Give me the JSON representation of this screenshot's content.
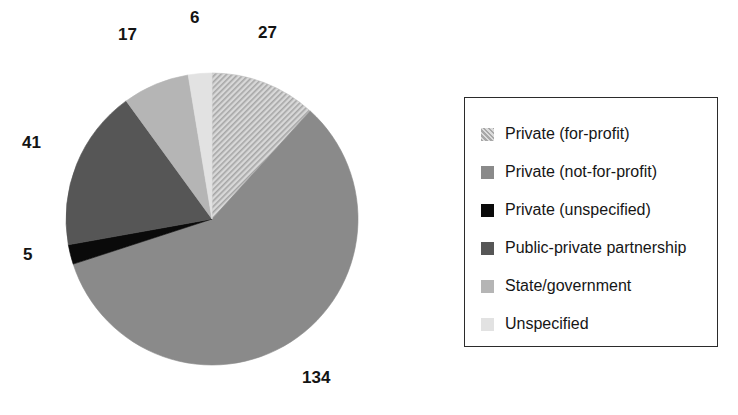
{
  "chart_data": {
    "type": "pie",
    "title": "",
    "subtitle": "",
    "xlabel": "",
    "ylabel": "",
    "total": 230,
    "legend_position": "right",
    "grid": false,
    "label_format": "count",
    "start_angle_deg": 0,
    "direction": "clockwise",
    "categories": [
      "Private (for-profit)",
      "Private (not-for-profit)",
      "Private (unspecified)",
      "Public-private partnership",
      "State/government",
      "Unspecified"
    ],
    "values": [
      27,
      134,
      5,
      41,
      17,
      6
    ],
    "labels": [
      "27",
      "134",
      "5",
      "41",
      "17",
      "6"
    ],
    "colors": [
      "#c9c9c9",
      "#8a8a8a",
      "#0a0a0a",
      "#565656",
      "#b5b5b5",
      "#e2e2e2"
    ],
    "patterns": [
      "diagonal-hatch",
      "solid",
      "solid",
      "solid",
      "solid",
      "solid"
    ],
    "slices": [
      {
        "name": "Private (for-profit)",
        "value": 27,
        "label": "27",
        "color": "#c9c9c9",
        "pattern": "diagonal-hatch"
      },
      {
        "name": "Private (not-for-profit)",
        "value": 134,
        "label": "134",
        "color": "#8a8a8a",
        "pattern": "solid"
      },
      {
        "name": "Private (unspecified)",
        "value": 5,
        "label": "5",
        "color": "#0a0a0a",
        "pattern": "solid"
      },
      {
        "name": "Public-private partnership",
        "value": 41,
        "label": "41",
        "color": "#565656",
        "pattern": "solid"
      },
      {
        "name": "State/government",
        "value": 17,
        "label": "17",
        "color": "#b5b5b5",
        "pattern": "solid"
      },
      {
        "name": "Unspecified",
        "value": 6,
        "label": "6",
        "color": "#e2e2e2",
        "pattern": "solid"
      }
    ]
  },
  "pie": {
    "labels": {
      "for_profit": "27",
      "not_for_profit": "134",
      "unspecified_private": "5",
      "public_private": "41",
      "state_government": "17",
      "unspecified": "6"
    }
  },
  "legend": {
    "items": [
      {
        "label": "Private (for-profit)",
        "color": "#c9c9c9",
        "pattern": "diagonal-hatch",
        "swatch_name": "legend-swatch-private-for-profit"
      },
      {
        "label": "Private (not-for-profit)",
        "color": "#8a8a8a",
        "pattern": "solid",
        "swatch_name": "legend-swatch-private-not-for-profit"
      },
      {
        "label": "Private (unspecified)",
        "color": "#0a0a0a",
        "pattern": "solid",
        "swatch_name": "legend-swatch-private-unspecified"
      },
      {
        "label": "Public-private partnership",
        "color": "#565656",
        "pattern": "solid",
        "swatch_name": "legend-swatch-public-private-partnership"
      },
      {
        "label": "State/government",
        "color": "#b5b5b5",
        "pattern": "solid",
        "swatch_name": "legend-swatch-state-government"
      },
      {
        "label": "Unspecified",
        "color": "#e2e2e2",
        "pattern": "solid",
        "swatch_name": "legend-swatch-unspecified"
      }
    ]
  }
}
